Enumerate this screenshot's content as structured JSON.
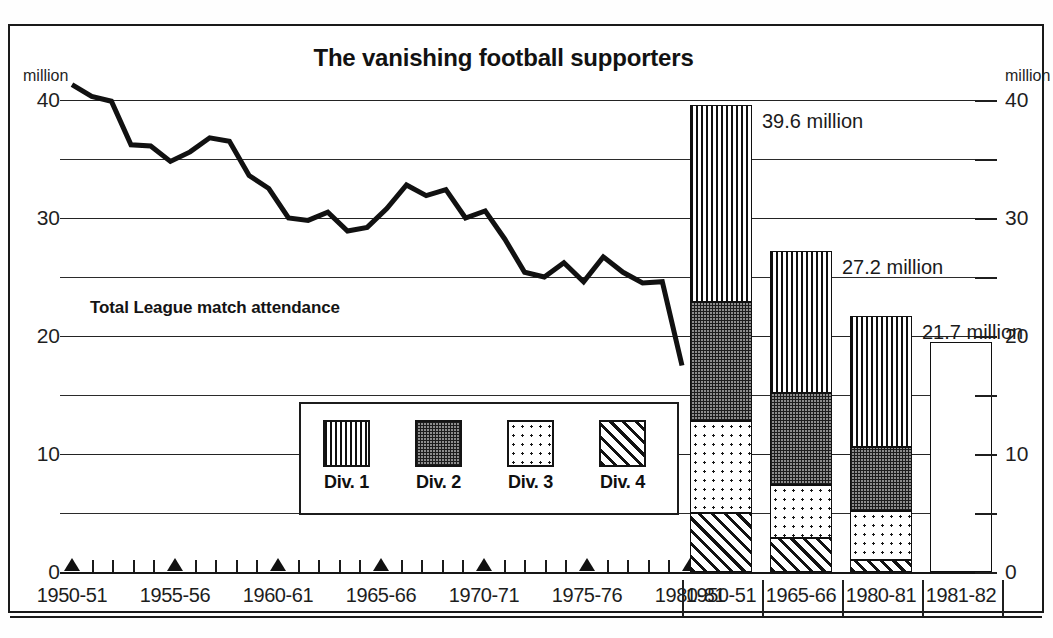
{
  "title": "The vanishing football supporters",
  "series_label": "Total League match attendance",
  "unit_left": "million",
  "unit_right": "million",
  "y_ticks": [
    "40",
    "30",
    "20",
    "10",
    "0"
  ],
  "y_ticks_right": [
    "40",
    "30",
    "20",
    "10",
    "0"
  ],
  "legend": {
    "items": [
      {
        "label": "Div. 1",
        "pattern": "vertical-stripes"
      },
      {
        "label": "Div. 2",
        "pattern": "dark-checker"
      },
      {
        "label": "Div. 3",
        "pattern": "light-dots"
      },
      {
        "label": "Div. 4",
        "pattern": "diagonal-hatch"
      }
    ]
  },
  "line_axis_labels": [
    "1950-51",
    "1955-56",
    "1960-61",
    "1965-66",
    "1970-71",
    "1975-76",
    "1980-81"
  ],
  "bar_axis_labels": [
    "1950-51",
    "1965-66",
    "1980-81",
    "1981-82"
  ],
  "bar_annotations": [
    "39.6 million",
    "27.2 million",
    "21.7 million"
  ],
  "colors": {
    "ink": "#111111",
    "grid": "#2b2b2b",
    "background": "#ffffff"
  },
  "chart_data": {
    "type": "line",
    "title": "The vanishing football supporters",
    "xlabel": "",
    "ylabel": "million",
    "ylim": [
      0,
      40
    ],
    "grid": true,
    "legend_position": "center",
    "panels": [
      {
        "type": "line",
        "name": "Total League match attendance",
        "ylim": [
          0,
          40
        ],
        "x": [
          "1949-50",
          "1950-51",
          "1951-52",
          "1952-53",
          "1953-54",
          "1954-55",
          "1955-56",
          "1956-57",
          "1957-58",
          "1958-59",
          "1959-60",
          "1960-61",
          "1961-62",
          "1962-63",
          "1963-64",
          "1964-65",
          "1965-66",
          "1966-67",
          "1967-68",
          "1968-69",
          "1969-70",
          "1970-71",
          "1971-72",
          "1972-73",
          "1973-74",
          "1974-75",
          "1975-76",
          "1976-77",
          "1977-78",
          "1978-79",
          "1979-80",
          "1980-81"
        ],
        "values": [
          41.3,
          40.3,
          39.9,
          36.2,
          36.1,
          34.8,
          35.6,
          36.8,
          36.5,
          33.6,
          32.5,
          30.0,
          29.8,
          30.5,
          28.9,
          29.2,
          30.8,
          32.8,
          31.9,
          32.4,
          30.0,
          30.6,
          28.2,
          25.4,
          25.0,
          26.2,
          24.6,
          26.7,
          25.4,
          24.5,
          24.6,
          17.5
        ],
        "line_color": "#111111",
        "line_width": 5
      },
      {
        "type": "bar",
        "subtype": "stacked",
        "categories": [
          "1950-51",
          "1965-66",
          "1980-81",
          "1981-82"
        ],
        "series": [
          {
            "name": "Div. 1",
            "values": [
              16.7,
              12.0,
              11.1,
              null
            ],
            "pattern": "vertical-stripes"
          },
          {
            "name": "Div. 2",
            "values": [
              10.1,
              7.8,
              5.4,
              null
            ],
            "pattern": "dark-checker"
          },
          {
            "name": "Div. 3",
            "values": [
              7.8,
              4.5,
              4.2,
              null
            ],
            "pattern": "light-dots"
          },
          {
            "name": "Div. 4",
            "values": [
              5.0,
              2.9,
              1.0,
              null
            ],
            "pattern": "diagonal-hatch"
          },
          {
            "name": "Total (unsplit)",
            "values": [
              null,
              null,
              null,
              19.5
            ],
            "pattern": "empty"
          }
        ],
        "totals": [
          39.6,
          27.2,
          21.7,
          19.5
        ],
        "total_labels": [
          "39.6 million",
          "27.2 million",
          "21.7 million",
          ""
        ],
        "ylim": [
          0,
          40
        ]
      }
    ]
  }
}
